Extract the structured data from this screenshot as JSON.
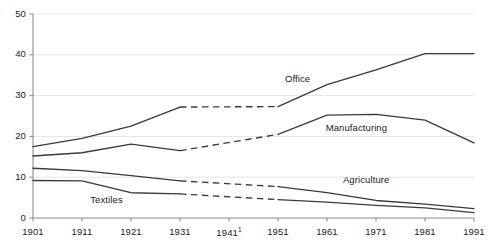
{
  "chart_data": {
    "type": "line",
    "title": "",
    "subtitle": "",
    "xlabel": "",
    "ylabel": "",
    "categories": [
      "1901",
      "1911",
      "1921",
      "1931",
      "1941",
      "1951",
      "1961",
      "1971",
      "1981",
      "1991"
    ],
    "x_tick_labels": [
      "1901",
      "1911",
      "1921",
      "1931",
      "1941",
      "1951",
      "1961",
      "1971",
      "1981",
      "1991"
    ],
    "x_tick_footnote": "1",
    "x_tick_footnote_on": "1941",
    "y_tick_labels": [
      "0",
      "10",
      "20",
      "30",
      "40",
      "50"
    ],
    "y_ticks": [
      0,
      10,
      20,
      30,
      40,
      50
    ],
    "ylim": [
      0,
      50
    ],
    "xlim": [
      "1901",
      "1991"
    ],
    "grid": "horizontal",
    "legend": "inline-labels",
    "dashed_range": [
      "1931",
      "1951"
    ],
    "series": [
      {
        "name": "Office",
        "label": "Office",
        "color": "#3a3a3a",
        "values": [
          17.5,
          19.5,
          22.5,
          27.2,
          null,
          27.3,
          32.7,
          36.3,
          40.3,
          40.3
        ],
        "dashed_segment": {
          "from": "1931",
          "to": "1951",
          "from_value": 27.2,
          "to_value": 27.3
        }
      },
      {
        "name": "Manufacturing",
        "label": "Manufacturing",
        "color": "#3a3a3a",
        "values": [
          15.2,
          16.0,
          18.1,
          16.5,
          null,
          20.5,
          25.2,
          25.4,
          24.0,
          18.4
        ],
        "dashed_segment": {
          "from": "1931",
          "to": "1951",
          "from_value": 16.5,
          "to_value": 20.5
        }
      },
      {
        "name": "Agriculture",
        "label": "Agriculture",
        "color": "#3a3a3a",
        "values": [
          12.2,
          11.6,
          10.4,
          9.1,
          null,
          7.7,
          6.2,
          4.3,
          3.4,
          2.3
        ],
        "dashed_segment": {
          "from": "1931",
          "to": "1951",
          "from_value": 9.1,
          "to_value": 7.7
        }
      },
      {
        "name": "Textiles",
        "label": "Textiles",
        "color": "#3a3a3a",
        "values": [
          9.2,
          9.1,
          6.2,
          5.9,
          null,
          4.5,
          3.9,
          3.1,
          2.5,
          1.3
        ],
        "dashed_segment": {
          "from": "1931",
          "to": "1951",
          "from_value": 5.9,
          "to_value": 4.5
        }
      }
    ],
    "annotations": [
      {
        "text": "Office",
        "x": "1955",
        "y": 34.0
      },
      {
        "text": "Manufacturing",
        "x": "1967",
        "y": 22.0
      },
      {
        "text": "Agriculture",
        "x": "1969",
        "y": 9.2
      },
      {
        "text": "Textiles",
        "x": "1916",
        "y": 4.3
      }
    ],
    "colors": {
      "line": "#3a3a3a",
      "axis": "#8c8c8c",
      "grid": "#e6e6e6",
      "text": "#1a1a1a",
      "background": "#ffffff"
    }
  }
}
